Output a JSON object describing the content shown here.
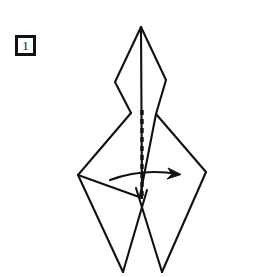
{
  "figure": {
    "background_color": "#ffffff",
    "stroke_color": "#111111",
    "width": 255,
    "height": 277
  },
  "step_label": {
    "number": "1",
    "name": "step-number-1"
  },
  "diagram": {
    "fold_line": {
      "type": "valley-fold-dashed",
      "label": "dashed vertical fold line",
      "dash_pattern": "5 4",
      "x": 142,
      "y_start": 110,
      "y_end": 200
    },
    "arrow": {
      "type": "curved-fold-arrow",
      "direction": "right",
      "label": "fold the near flap over to the right",
      "path": "M 110 180 Q 142 168 178 174",
      "head_x": 180,
      "head_y": 174
    },
    "outline_paths": [
      {
        "name": "top-point-left-edge",
        "d": "M 141 27 L 115 82 L 131 113"
      },
      {
        "name": "top-point-right-edge",
        "d": "M 141 27 L 166 80 L 156 114"
      },
      {
        "name": "center-spine",
        "d": "M 141 27 L 142 198"
      },
      {
        "name": "left-body-upper-edge",
        "d": "M 131 113 L 78 175"
      },
      {
        "name": "left-body-lower-edge",
        "d": "M 78 175 L 142 198"
      },
      {
        "name": "right-body-upper-edge",
        "d": "M 156 114 L 206 172"
      },
      {
        "name": "right-body-lower-edge",
        "d": "M 206 172 L 162 272"
      },
      {
        "name": "left-leg-outer",
        "d": "M 78 175 L 123 272"
      },
      {
        "name": "left-leg-inner",
        "d": "M 123 272 L 147 190"
      },
      {
        "name": "right-leg-inner",
        "d": "M 162 272 L 136 188"
      },
      {
        "name": "inner-right-flap",
        "d": "M 156 114 L 140 196"
      }
    ]
  }
}
